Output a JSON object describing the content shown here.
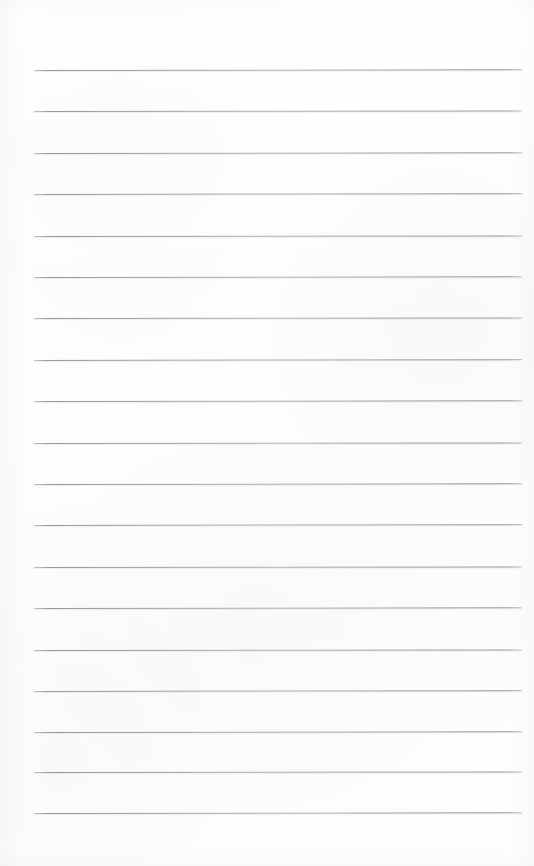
{
  "document": {
    "type": "lined-notebook-page",
    "title": "Blank lined page",
    "content_text": "",
    "visible_text_count": 0,
    "has_handwriting": false,
    "has_printed_text": false,
    "has_header": false,
    "has_page_number": false,
    "has_margin_rule": false
  },
  "page": {
    "width": 534,
    "height": 866,
    "background_color": "#fdfdfd",
    "paper_tone": "off-white",
    "orientation": "portrait"
  },
  "ruling": {
    "style": "wide-ruled",
    "line_color": "#8d9197",
    "line_thickness": 1,
    "line_count": 19,
    "line_spacing": 41.4,
    "first_line_y": 70,
    "last_line_y": 813,
    "line_start_x": 34,
    "line_end_x": 522,
    "line_length": 488,
    "top_margin": 70,
    "bottom_margin": 53,
    "left_margin": 34,
    "right_margin": 12,
    "lines": [
      {
        "index": 1,
        "y": 70,
        "x_start": 34,
        "x_end": 522,
        "skew": "skew-a"
      },
      {
        "index": 2,
        "y": 111,
        "x_start": 34,
        "x_end": 522,
        "skew": "skew-b"
      },
      {
        "index": 3,
        "y": 153,
        "x_start": 34,
        "x_end": 522,
        "skew": "skew-a"
      },
      {
        "index": 4,
        "y": 194,
        "x_start": 34,
        "x_end": 522,
        "skew": "skew-c"
      },
      {
        "index": 5,
        "y": 236,
        "x_start": 34,
        "x_end": 522,
        "skew": "skew-b"
      },
      {
        "index": 6,
        "y": 277,
        "x_start": 34,
        "x_end": 522,
        "skew": "skew-a"
      },
      {
        "index": 7,
        "y": 318,
        "x_start": 34,
        "x_end": 522,
        "skew": "skew-b"
      },
      {
        "index": 8,
        "y": 360,
        "x_start": 34,
        "x_end": 522,
        "skew": "skew-c"
      },
      {
        "index": 9,
        "y": 401,
        "x_start": 34,
        "x_end": 522,
        "skew": "skew-a"
      },
      {
        "index": 10,
        "y": 443,
        "x_start": 34,
        "x_end": 522,
        "skew": "skew-b"
      },
      {
        "index": 11,
        "y": 484,
        "x_start": 34,
        "x_end": 522,
        "skew": "skew-a"
      },
      {
        "index": 12,
        "y": 525,
        "x_start": 34,
        "x_end": 522,
        "skew": "skew-c"
      },
      {
        "index": 13,
        "y": 567,
        "x_start": 34,
        "x_end": 522,
        "skew": "skew-b"
      },
      {
        "index": 14,
        "y": 608,
        "x_start": 34,
        "x_end": 522,
        "skew": "skew-a"
      },
      {
        "index": 15,
        "y": 650,
        "x_start": 34,
        "x_end": 522,
        "skew": "skew-b"
      },
      {
        "index": 16,
        "y": 691,
        "x_start": 34,
        "x_end": 522,
        "skew": "skew-c"
      },
      {
        "index": 17,
        "y": 732,
        "x_start": 34,
        "x_end": 522,
        "skew": "skew-a"
      },
      {
        "index": 18,
        "y": 772,
        "x_start": 34,
        "x_end": 522,
        "skew": "skew-b"
      },
      {
        "index": 19,
        "y": 813,
        "x_start": 34,
        "x_end": 522,
        "skew": "skew-a"
      }
    ]
  }
}
